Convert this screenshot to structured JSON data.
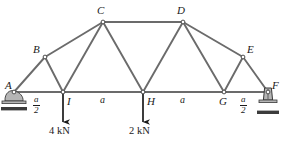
{
  "figure": {
    "type": "truss-free-body-diagram",
    "width": 287,
    "height": 146,
    "background_color": "#ffffff",
    "member_color": "#6b6b6b",
    "outline_color": "#3a3a3a",
    "text_color": "#1a1a1a",
    "joint_fill": "#ffffff",
    "arrow_color": "#1a1a1a",
    "support_fill": "#b5b5b5"
  },
  "nodes": [
    {
      "id": "A",
      "label": "A",
      "x": 14,
      "y": 92,
      "label_x": 5,
      "label_y": 80
    },
    {
      "id": "B",
      "label": "B",
      "x": 45,
      "y": 57,
      "label_x": 33,
      "label_y": 44
    },
    {
      "id": "C",
      "label": "C",
      "x": 103,
      "y": 22,
      "label_x": 97,
      "label_y": 5
    },
    {
      "id": "D",
      "label": "D",
      "x": 183,
      "y": 22,
      "label_x": 177,
      "label_y": 5
    },
    {
      "id": "E",
      "label": "E",
      "x": 243,
      "y": 57,
      "label_x": 247,
      "label_y": 44
    },
    {
      "id": "F",
      "label": "F",
      "x": 268,
      "y": 92,
      "label_x": 272,
      "label_y": 80
    },
    {
      "id": "G",
      "label": "G",
      "x": 224,
      "y": 92,
      "label_x": 219,
      "label_y": 96
    },
    {
      "id": "H",
      "label": "H",
      "x": 143,
      "y": 92,
      "label_x": 147,
      "label_y": 96
    },
    {
      "id": "I",
      "label": "I",
      "x": 63,
      "y": 92,
      "label_x": 67,
      "label_y": 96
    }
  ],
  "members": [
    {
      "from": "A",
      "to": "B",
      "name": "member-AB"
    },
    {
      "from": "B",
      "to": "C",
      "name": "member-BC"
    },
    {
      "from": "C",
      "to": "D",
      "name": "member-CD"
    },
    {
      "from": "D",
      "to": "E",
      "name": "member-DE"
    },
    {
      "from": "E",
      "to": "F",
      "name": "member-EF"
    },
    {
      "from": "A",
      "to": "I",
      "name": "member-AI"
    },
    {
      "from": "I",
      "to": "H",
      "name": "member-IH"
    },
    {
      "from": "H",
      "to": "G",
      "name": "member-HG"
    },
    {
      "from": "G",
      "to": "F",
      "name": "member-GF"
    },
    {
      "from": "B",
      "to": "I",
      "name": "member-BI"
    },
    {
      "from": "C",
      "to": "I",
      "name": "member-CI"
    },
    {
      "from": "C",
      "to": "H",
      "name": "member-CH"
    },
    {
      "from": "D",
      "to": "H",
      "name": "member-DH"
    },
    {
      "from": "D",
      "to": "G",
      "name": "member-DG"
    },
    {
      "from": "E",
      "to": "G",
      "name": "member-EG"
    }
  ],
  "loads": [
    {
      "name": "load-at-I",
      "at_node": "I",
      "magnitude": "4",
      "unit": "kN",
      "text": "4 kN",
      "direction": "down",
      "x": 63,
      "y_start": 93,
      "y_end": 122,
      "label_x": 49,
      "label_y": 126
    },
    {
      "name": "load-at-H",
      "at_node": "H",
      "magnitude": "2",
      "unit": "kN",
      "text": "2 kN",
      "direction": "down",
      "x": 143,
      "y_start": 93,
      "y_end": 122,
      "label_x": 129,
      "label_y": 126
    }
  ],
  "dimensions": [
    {
      "name": "dim-A-I",
      "kind": "fraction",
      "numerator": "a",
      "denominator": "2",
      "x": 33,
      "y": 95
    },
    {
      "name": "dim-I-H",
      "kind": "plain",
      "text": "a",
      "x": 100,
      "y": 95
    },
    {
      "name": "dim-H-G",
      "kind": "plain",
      "text": "a",
      "x": 180,
      "y": 95
    },
    {
      "name": "dim-G-F",
      "kind": "fraction",
      "numerator": "a",
      "denominator": "2",
      "x": 240,
      "y": 95
    }
  ],
  "supports": [
    {
      "name": "support-roller-A",
      "type": "rocker-roller",
      "at_node": "A",
      "x": 14,
      "y": 92,
      "ground_y": 105
    },
    {
      "name": "support-pin-F",
      "type": "pin",
      "at_node": "F",
      "x": 268,
      "y": 92,
      "ground_y": 104
    }
  ]
}
